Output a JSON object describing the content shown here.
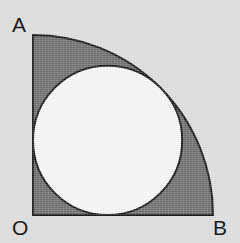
{
  "figure": {
    "background_color": "#dcdcdc",
    "shaded_region_color": "#6e6e6e",
    "inner_circle_color": "#f5f5f3",
    "outline_color": "#181818",
    "outline_width": 2,
    "label_color": "#1b1b1b",
    "labels": {
      "a": "A",
      "o": "O",
      "b": "B"
    },
    "geometry": {
      "origin_x": 33,
      "origin_y": 215,
      "quarter_radius": 180,
      "point_a_x": 33,
      "point_a_y": 35,
      "point_b_x": 213,
      "point_b_y": 215,
      "inner_circle_center_x": 107.6,
      "inner_circle_center_y": 140.4,
      "inner_circle_radius": 74.6
    }
  }
}
